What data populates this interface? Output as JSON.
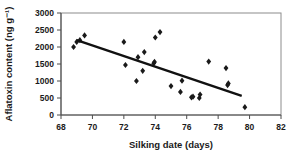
{
  "chart_data": {
    "type": "scatter",
    "title": "",
    "xlabel": "Silking date (days)",
    "ylabel": "Aflatoxin content (ng g⁻¹)",
    "xlim": [
      68,
      82
    ],
    "ylim": [
      0,
      3000
    ],
    "xticks": [
      68,
      70,
      72,
      74,
      76,
      78,
      80,
      82
    ],
    "yticks": [
      0,
      500,
      1000,
      1500,
      2000,
      2500,
      3000
    ],
    "xtick_labels": [
      "68",
      "70",
      "72",
      "74",
      "76",
      "78",
      "80",
      "82"
    ],
    "ytick_labels": [
      "0",
      "500",
      "1000",
      "1500",
      "2000",
      "2500",
      "3000"
    ],
    "grid": false,
    "legend": null,
    "marker_style": "diamond",
    "marker_color": "#1a1a1a",
    "points": [
      {
        "x": 68.8,
        "y": 2000
      },
      {
        "x": 69.0,
        "y": 2150
      },
      {
        "x": 69.2,
        "y": 2200
      },
      {
        "x": 69.5,
        "y": 2340
      },
      {
        "x": 72.0,
        "y": 2150
      },
      {
        "x": 72.1,
        "y": 1470
      },
      {
        "x": 72.8,
        "y": 1000
      },
      {
        "x": 72.9,
        "y": 1700
      },
      {
        "x": 73.2,
        "y": 1300
      },
      {
        "x": 73.3,
        "y": 1850
      },
      {
        "x": 73.9,
        "y": 1520
      },
      {
        "x": 73.95,
        "y": 1560
      },
      {
        "x": 74.0,
        "y": 2280
      },
      {
        "x": 74.3,
        "y": 2440
      },
      {
        "x": 75.0,
        "y": 850
      },
      {
        "x": 75.6,
        "y": 680
      },
      {
        "x": 75.7,
        "y": 1010
      },
      {
        "x": 76.3,
        "y": 520
      },
      {
        "x": 76.4,
        "y": 540
      },
      {
        "x": 76.8,
        "y": 500
      },
      {
        "x": 76.85,
        "y": 600
      },
      {
        "x": 77.4,
        "y": 1570
      },
      {
        "x": 78.5,
        "y": 1380
      },
      {
        "x": 78.6,
        "y": 880
      },
      {
        "x": 78.65,
        "y": 930
      },
      {
        "x": 79.7,
        "y": 230
      }
    ],
    "trend_line": {
      "x_start": 69.0,
      "y_start": 2200,
      "x_end": 79.5,
      "y_end": 560,
      "color": "#111111"
    }
  }
}
